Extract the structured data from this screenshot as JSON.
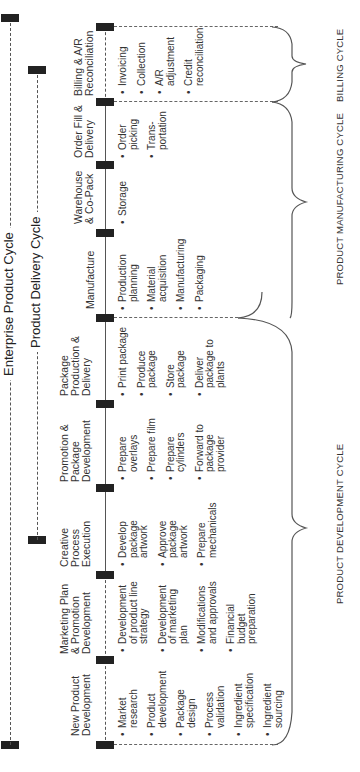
{
  "lines": {
    "enterprise": {
      "label": "Enterprise Product Cycle"
    },
    "delivery": {
      "label": "Product Delivery Cycle"
    }
  },
  "stages": [
    {
      "title": "New Product Development",
      "bullets": [
        "Market research",
        "Product development",
        "Package design",
        "Process validation",
        "Ingredient specification",
        "Ingredient sourcing"
      ]
    },
    {
      "title": "Marketing Plan & Promotion Development",
      "bullets": [
        "Development of product line strategy",
        "Development of marketing plan",
        "Modifications and approvals",
        "Financial budget preparation"
      ]
    },
    {
      "title": "Creative Process Execution",
      "bullets": [
        "Develop package artwork",
        "Approve package artwork",
        "Prepare mechanicals"
      ]
    },
    {
      "title": "Promotion & Package Development",
      "bullets": [
        "Prepare overlays",
        "Prepare film",
        "Prepare cylinders",
        "Forward to package provider"
      ]
    },
    {
      "title": "Package Production & Delivery",
      "bullets": [
        "Print package",
        "Produce package",
        "Store package",
        "Deliver package to plants"
      ]
    },
    {
      "title": "Manufacture",
      "bullets": [
        "Production planning",
        "Material acquisition",
        "Manufacturing",
        "Packaging"
      ]
    },
    {
      "title": "Warehouse & Co-Pack",
      "bullets": [
        "Storage"
      ]
    },
    {
      "title": "Order Fill & Delivery",
      "bullets": [
        "Order picking",
        "Trans-portation"
      ]
    },
    {
      "title": "Billing & A/R Reconciliation",
      "bullets": [
        "Invoicing",
        "Collection",
        "A/R adjustment",
        "Credit reconciliation"
      ]
    }
  ],
  "phases": [
    {
      "label": "PRODUCT DEVELOPMENT CYCLE"
    },
    {
      "label": "PRODUCT MANUFACTURING CYCLE"
    },
    {
      "label": "BILLING CYCLE"
    }
  ],
  "colors": {
    "line": "#555555",
    "marker": "#222222",
    "text": "#333333",
    "background": "#ffffff"
  }
}
